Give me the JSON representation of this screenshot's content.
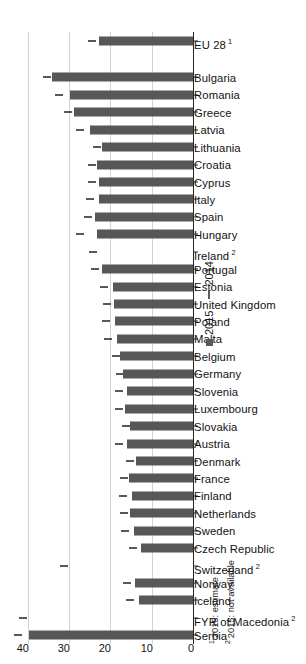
{
  "chart_data": {
    "type": "bar",
    "orientation": "horizontal",
    "title": "",
    "xlabel": "",
    "ylabel": "",
    "ylim": [
      0,
      45
    ],
    "ticks": [
      0,
      10,
      20,
      30,
      40
    ],
    "tick_labels": [
      "0",
      "10",
      "20",
      "30",
      "40"
    ],
    "grid": true,
    "legend_position": "right",
    "categories": [
      "Serbia",
      "FYR of Macedonia",
      "Iceland",
      "Norway",
      "Switzerland",
      "Czech Republic",
      "Sweden",
      "Netherlands",
      "Finland",
      "France",
      "Denmark",
      "Austria",
      "Slovakia",
      "Luxembourg",
      "Slovenia",
      "Germany",
      "Belgium",
      "Malta",
      "Poland",
      "United Kingdom",
      "Estonia",
      "Portugal",
      "Ireland",
      "Hungary",
      "Spain",
      "Italy",
      "Cyprus",
      "Croatia",
      "Lithuania",
      "Latvia",
      "Greece",
      "Romania",
      "Bulgaria",
      "EU 28"
    ],
    "category_footnote_marks": {
      "FYR of Macedonia": "2",
      "Switzerland": "2",
      "Ireland": "2",
      "EU 28": "1"
    },
    "series": [
      {
        "name": "2015",
        "marker": "filled-square",
        "color": "#575757",
        "values": [
          40.0,
          null,
          13.4,
          14.3,
          null,
          12.9,
          14.5,
          15.6,
          14.9,
          15.7,
          14.1,
          16.3,
          15.4,
          16.6,
          16.2,
          17.3,
          17.9,
          18.6,
          19.2,
          19.4,
          19.6,
          22.2,
          null,
          23.4,
          23.9,
          23.1,
          23.0,
          23.5,
          22.3,
          25.2,
          29.1,
          30.0,
          34.4,
          23.0
        ]
      },
      {
        "name": "2014",
        "marker": "dash",
        "color": "#585858",
        "values": [
          41.5,
          40.5,
          14.6,
          15.3,
          30.5,
          13.8,
          15.7,
          15.9,
          16.2,
          16.0,
          14.6,
          17.1,
          15.4,
          17.1,
          17.2,
          16.9,
          17.8,
          19.8,
          20.3,
          20.0,
          20.8,
          22.9,
          23.5,
          26.5,
          24.8,
          24.1,
          23.7,
          23.6,
          22.5,
          26.5,
          29.6,
          31.7,
          34.6,
          23.8
        ]
      }
    ],
    "legend": [
      {
        "label": "2015",
        "marker": "filled-square"
      },
      {
        "label": "2014",
        "marker": "dash"
      }
    ],
    "footnotes": [
      {
        "mark": "1",
        "text": "2015: estimate"
      },
      {
        "mark": "2",
        "text": "2015: not available"
      }
    ]
  }
}
